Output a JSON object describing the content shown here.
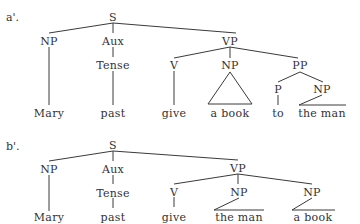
{
  "trees": [
    {
      "id": "a",
      "tag": "a'.",
      "nodes": {
        "S": "S",
        "NP1": "NP",
        "Aux": "Aux",
        "Tense": "Tense",
        "VP": "VP",
        "V": "V",
        "NP2": "NP",
        "PP": "PP",
        "P": "P",
        "NP3": "NP"
      },
      "leaves": {
        "mary": "Mary",
        "past": "past",
        "give": "give",
        "np2": "a book",
        "to": "to",
        "np3": "the man"
      }
    },
    {
      "id": "b",
      "tag": "b'.",
      "nodes": {
        "S": "S",
        "NP1": "NP",
        "Aux": "Aux",
        "Tense": "Tense",
        "VP": "VP",
        "V": "V",
        "NP2": "NP",
        "NP3": "NP"
      },
      "leaves": {
        "mary": "Mary",
        "past": "past",
        "give": "give",
        "np2": "the man",
        "np3": "a book"
      }
    }
  ]
}
